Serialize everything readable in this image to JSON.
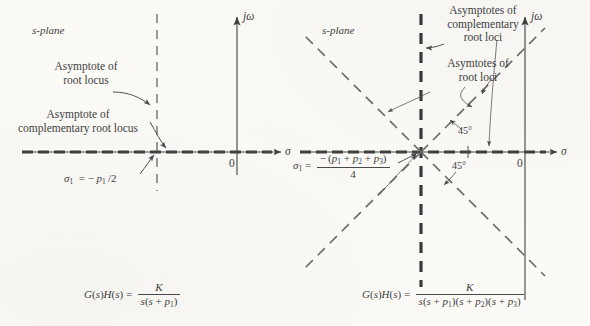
{
  "figure": {
    "background_color": "#fbfaf7",
    "ink_color": "#3f3f3f",
    "panels": [
      {
        "id": "left",
        "plane_label": "s-plane",
        "axis_real_label": "σ",
        "axis_imag_label": "jω",
        "origin_label": "0",
        "annotations": [
          {
            "id": "asymptote-root-locus",
            "line1": "Asymptote of",
            "line2": "root locus"
          },
          {
            "id": "asymptote-complementary-root-locus",
            "line1": "Asymptote of",
            "line2": "complementary root locus"
          }
        ],
        "sigma": {
          "symbol": "σ",
          "subscript": "1",
          "equals": "= −",
          "expression_numerator": "p",
          "expression_numerator_sub": "1",
          "expression_divisor": "/2",
          "full_text": "σ₁ = −p₁/2"
        },
        "equation": {
          "lhs": "G(s)H(s) =",
          "numerator": "K",
          "denominator": "s(s + p₁)",
          "full_text": "G(s)H(s) = K / s(s + p₁)"
        }
      },
      {
        "id": "right",
        "plane_label": "s-plane",
        "axis_real_label": "σ",
        "axis_imag_label": "jω",
        "origin_label": "0",
        "annotations": [
          {
            "id": "asymptotes-complementary-root-loci",
            "line1": "Asymptotes of",
            "line2": "complementary",
            "line3": "root loci"
          },
          {
            "id": "asymtotes-root-loci",
            "line1": "Asymtotes of",
            "line2": "root loci"
          }
        ],
        "angle_labels": [
          {
            "id": "angle-upper",
            "text": "45°"
          },
          {
            "id": "angle-lower",
            "text": "45°"
          }
        ],
        "sigma": {
          "symbol": "σ",
          "subscript": "1",
          "equals": "=",
          "numerator": "− (p₁ + p₂ + p₃)",
          "denominator": "4",
          "full_text": "σ₁ = −(p₁ + p₂ + p₃)/4"
        },
        "equation": {
          "lhs": "G(s)H(s) =",
          "numerator": "K",
          "denominator": "s(s + p₁)(s + p₂)(s + p₃)",
          "full_text": "G(s)H(s) = K / s(s + p₁)(s + p₂)(s + p₃)"
        }
      }
    ]
  }
}
